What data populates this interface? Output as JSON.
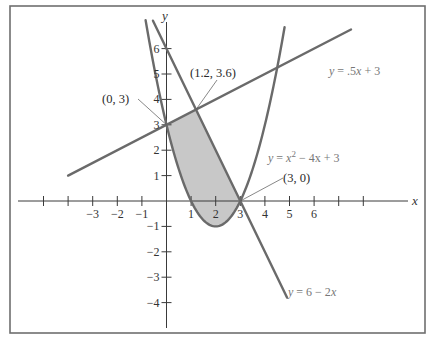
{
  "chart_data": {
    "type": "line",
    "title": "",
    "xlabel": "x",
    "ylabel": "y",
    "xlim": [
      -5,
      7
    ],
    "ylim": [
      -4,
      7
    ],
    "grid": false,
    "legend": "none (inline equation labels)",
    "x_ticks": [
      -5,
      -4,
      -3,
      -2,
      -1,
      1,
      2,
      3,
      4,
      5,
      6,
      7,
      8
    ],
    "x_tick_labels": [
      {
        "value": -3,
        "label": "−3"
      },
      {
        "value": -2,
        "label": "−2"
      },
      {
        "value": -1,
        "label": "−1"
      },
      {
        "value": 1,
        "label": "1"
      },
      {
        "value": 2,
        "label": "2"
      },
      {
        "value": 3,
        "label": "3"
      },
      {
        "value": 4,
        "label": "4"
      },
      {
        "value": 5,
        "label": "5"
      },
      {
        "value": 6,
        "label": "6"
      }
    ],
    "y_ticks": [
      -4,
      -3,
      -2,
      -1,
      1,
      2,
      3,
      4,
      5,
      6
    ],
    "y_tick_labels": [
      {
        "value": 6,
        "label": "6"
      },
      {
        "value": 5,
        "label": "5"
      },
      {
        "value": 4,
        "label": "4"
      },
      {
        "value": 3,
        "label": "3"
      },
      {
        "value": 2,
        "label": "2"
      },
      {
        "value": 1,
        "label": "1"
      },
      {
        "value": -1,
        "label": "−1"
      },
      {
        "value": -2,
        "label": "−2"
      },
      {
        "value": -3,
        "label": "−3"
      },
      {
        "value": -4,
        "label": "−4"
      }
    ],
    "series": [
      {
        "name": "y = .5x + 3",
        "kind": "linear",
        "slope": 0.5,
        "intercept": 3,
        "x_range": [
          -4,
          7.5
        ],
        "label": {
          "prefix": "y",
          "rest": " = .5",
          "var": "x",
          "suffix": " + 3"
        }
      },
      {
        "name": "y = x^2 - 4x + 3",
        "kind": "quadratic",
        "coeffs": [
          1,
          -4,
          3
        ],
        "x_range": [
          -0.85,
          4.8
        ],
        "label": {
          "prefix": "y",
          "rest": " = ",
          "var": "x",
          "sup": "2",
          "suffix": " − 4x + 3"
        }
      },
      {
        "name": "y = 6 - 2x",
        "kind": "linear",
        "slope": -2,
        "intercept": 6,
        "x_range": [
          -0.55,
          4.9
        ],
        "label": {
          "prefix": "y",
          "rest": " = 6 − 2",
          "var": "x",
          "suffix": ""
        }
      }
    ],
    "shaded_region": {
      "description": "Region bounded above by y = .5x + 3 and y = 6 - 2x, below by y = x^2 - 4x + 3",
      "vertices": [
        [
          0,
          3
        ],
        [
          1.2,
          3.6
        ],
        [
          3,
          0
        ]
      ],
      "fill": "#c8c8c8"
    },
    "annotations": [
      {
        "text": "(0, 3)",
        "point": [
          0,
          3
        ]
      },
      {
        "text": "(1.2, 3.6)",
        "point": [
          1.2,
          3.6
        ]
      },
      {
        "text": "(3, 0)",
        "point": [
          3,
          0
        ]
      }
    ],
    "colors": {
      "curves": "#6a6a6a",
      "axes": "#3a3a3a",
      "frame": "#6f6f6f",
      "shade": "#c8c8c8"
    }
  },
  "labels": {
    "x_axis": "x",
    "y_axis": "y",
    "point_0_3": "(0, 3)",
    "point_12_36": "(1.2, 3.6)",
    "point_3_0": "(3, 0)",
    "eq_line1": "y = .5x + 3",
    "eq_parabola": "y = x² − 4x + 3",
    "eq_line2": "y = 6 − 2x"
  }
}
